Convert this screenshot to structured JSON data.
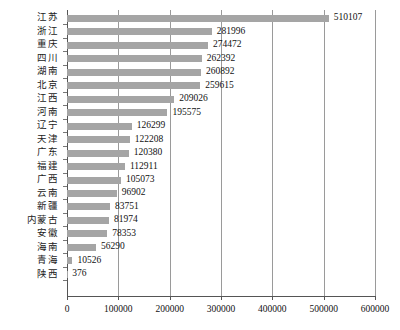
{
  "chart_data": {
    "type": "bar",
    "orientation": "horizontal",
    "title": "",
    "xlabel": "",
    "ylabel": "",
    "xlim": [
      0,
      600000
    ],
    "ylim": null,
    "grid": true,
    "legend": false,
    "legend_position": "none",
    "bar_color": "#a5a5a5",
    "axis_color": "#555555",
    "gridline_color": "#9a9a9a",
    "value_labels": true,
    "xticks": [
      0,
      100000,
      200000,
      300000,
      400000,
      500000,
      600000
    ],
    "xtick_labels": [
      "0",
      "100000",
      "200000",
      "300000",
      "400000",
      "500000",
      "600000"
    ],
    "categories": [
      "江苏",
      "浙江",
      "重庆",
      "四川",
      "湖南",
      "北京",
      "江西",
      "河南",
      "辽宁",
      "天津",
      "广东",
      "福建",
      "广西",
      "云南",
      "新疆",
      "内蒙古",
      "安徽",
      "海南",
      "青海",
      "陕西"
    ],
    "values": [
      510107,
      281996,
      274472,
      262392,
      260892,
      259615,
      209026,
      195575,
      126299,
      122208,
      120380,
      112911,
      105073,
      96902,
      83751,
      81974,
      78353,
      56290,
      10526,
      376
    ],
    "value_label_texts": [
      "510107",
      "281996",
      "274472",
      "262392",
      "260892",
      "259615",
      "209026",
      "195575",
      "126299",
      "122208",
      "120380",
      "112911",
      "105073",
      "96902",
      "83751",
      "81974",
      "78353",
      "56290",
      "10526",
      "376"
    ]
  }
}
